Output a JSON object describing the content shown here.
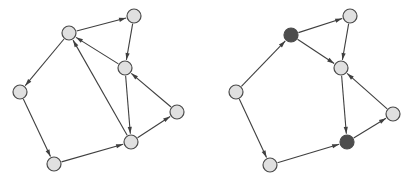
{
  "figure": {
    "title": "",
    "background_color": "#ffffff",
    "width": 416,
    "height": 182,
    "panel_count": 2
  },
  "style": {
    "edge_color": "#3f3f3f",
    "edge_width": 1.1,
    "node_stroke": "#4a4a4a",
    "node_stroke_width": 1.2,
    "node_radius": 7,
    "fill_light": "#e0e0e0",
    "fill_dark": "#4d4d4d",
    "arrow_length": 7,
    "arrow_width": 4.2
  },
  "graphs": [
    {
      "name": "left-graph",
      "label": "",
      "nodes": [
        {
          "id": "a",
          "name": "node-a",
          "x": 69,
          "y": 33,
          "fill": "#e0e0e0",
          "shade": "light"
        },
        {
          "id": "b",
          "name": "node-b",
          "x": 134,
          "y": 16,
          "fill": "#e0e0e0",
          "shade": "light"
        },
        {
          "id": "c",
          "name": "node-c",
          "x": 125,
          "y": 68,
          "fill": "#e0e0e0",
          "shade": "light"
        },
        {
          "id": "d",
          "name": "node-d",
          "x": 20,
          "y": 92,
          "fill": "#e0e0e0",
          "shade": "light"
        },
        {
          "id": "e",
          "name": "node-e",
          "x": 54,
          "y": 164,
          "fill": "#e0e0e0",
          "shade": "light"
        },
        {
          "id": "f",
          "name": "node-f",
          "x": 131,
          "y": 142,
          "fill": "#e0e0e0",
          "shade": "light"
        },
        {
          "id": "g",
          "name": "node-g",
          "x": 177,
          "y": 112,
          "fill": "#e0e0e0",
          "shade": "light"
        }
      ],
      "edges": [
        {
          "from": "a",
          "to": "b",
          "name": "edge-a-b"
        },
        {
          "from": "b",
          "to": "c",
          "name": "edge-b-c"
        },
        {
          "from": "c",
          "to": "a",
          "name": "edge-c-a"
        },
        {
          "from": "a",
          "to": "d",
          "name": "edge-a-d"
        },
        {
          "from": "d",
          "to": "e",
          "name": "edge-d-e"
        },
        {
          "from": "e",
          "to": "f",
          "name": "edge-e-f"
        },
        {
          "from": "f",
          "to": "a",
          "name": "edge-f-a"
        },
        {
          "from": "c",
          "to": "f",
          "name": "edge-c-f"
        },
        {
          "from": "f",
          "to": "g",
          "name": "edge-f-g"
        },
        {
          "from": "g",
          "to": "c",
          "name": "edge-g-c"
        }
      ]
    },
    {
      "name": "right-graph",
      "label": "",
      "nodes": [
        {
          "id": "a",
          "name": "node-a",
          "x": 291,
          "y": 35,
          "fill": "#4d4d4d",
          "shade": "dark"
        },
        {
          "id": "b",
          "name": "node-b",
          "x": 350,
          "y": 16,
          "fill": "#e0e0e0",
          "shade": "light"
        },
        {
          "id": "c",
          "name": "node-c",
          "x": 341,
          "y": 68,
          "fill": "#e0e0e0",
          "shade": "light"
        },
        {
          "id": "d",
          "name": "node-d",
          "x": 236,
          "y": 92,
          "fill": "#e0e0e0",
          "shade": "light"
        },
        {
          "id": "e",
          "name": "node-e",
          "x": 270,
          "y": 165,
          "fill": "#e0e0e0",
          "shade": "light"
        },
        {
          "id": "f",
          "name": "node-f",
          "x": 347,
          "y": 142,
          "fill": "#4d4d4d",
          "shade": "dark"
        },
        {
          "id": "g",
          "name": "node-g",
          "x": 393,
          "y": 114,
          "fill": "#e0e0e0",
          "shade": "light"
        }
      ],
      "edges": [
        {
          "from": "a",
          "to": "b",
          "name": "edge-a-b"
        },
        {
          "from": "b",
          "to": "c",
          "name": "edge-b-c"
        },
        {
          "from": "a",
          "to": "c",
          "name": "edge-a-c"
        },
        {
          "from": "d",
          "to": "a",
          "name": "edge-d-a"
        },
        {
          "from": "d",
          "to": "e",
          "name": "edge-d-e"
        },
        {
          "from": "e",
          "to": "f",
          "name": "edge-e-f"
        },
        {
          "from": "c",
          "to": "f",
          "name": "edge-c-f"
        },
        {
          "from": "f",
          "to": "g",
          "name": "edge-f-g"
        },
        {
          "from": "g",
          "to": "c",
          "name": "edge-g-c"
        }
      ]
    }
  ]
}
